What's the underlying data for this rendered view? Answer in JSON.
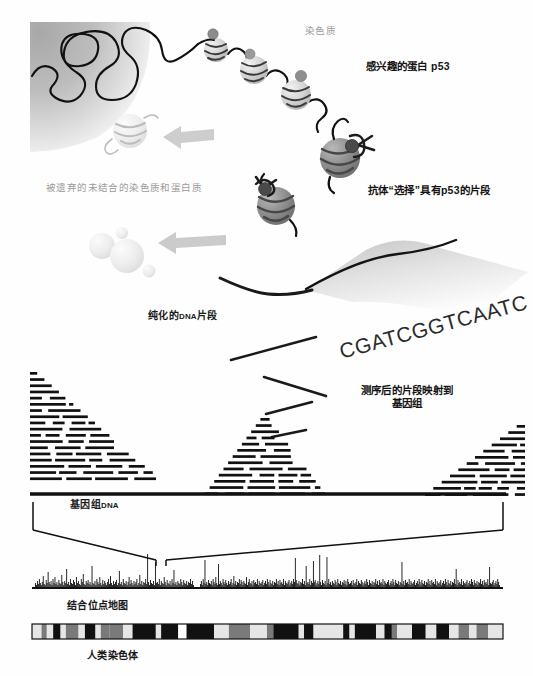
{
  "figure": {
    "title_semantic": "ChIP-seq workflow diagram",
    "background": "#ffffff"
  },
  "labels": {
    "chromatin": "染色质",
    "protein_of_interest": "感兴趣的蛋白 p53",
    "discarded": "被遗弃的未结合的染色质和蛋白质",
    "antibody_selects": "抗体“选择”具有p53的片段",
    "purified_prefix": "纯化的",
    "purified_dna": "DNA",
    "purified_suffix": "片段",
    "mapping_line1": "测序后的片段映射到",
    "mapping_line2": "基因组",
    "genomic_prefix": "基因组",
    "genomic_dna": "DNA",
    "binding_site_map": "结合位点地图",
    "human_chromosome": "人类染色体"
  },
  "sequence": {
    "text": "CGATCGGTCAATC",
    "rotation_deg": -15
  },
  "colors": {
    "ink": "#1a1a1a",
    "gray_label": "#9a9a9a",
    "nucleus_fill_dark": "#9d9d9d",
    "nucleus_fill_light": "#ffffff",
    "nucleosome_light": "#d8d8d8",
    "nucleosome_dark": "#8e8e8e",
    "discard_pale": "#ededed",
    "arrow_gray": "#c9c9c9",
    "peak_black": "#111111",
    "chrom_band_dark": "#111111",
    "chrom_band_mid": "#7a7a7a",
    "chrom_band_light": "#e6e6e6"
  },
  "chart_data": {
    "type": "bar",
    "title": "结合位点地图",
    "xlabel": "",
    "ylabel": "",
    "ylim": [
      0,
      44
    ],
    "grid": false,
    "legend": null,
    "note": "Binding-site peak track: tick heights in px along the genome axis",
    "segments": [
      {
        "name": "left-arm",
        "x_start": 35,
        "x_end": 194,
        "values": [
          5,
          3,
          7,
          4,
          9,
          5,
          3,
          6,
          12,
          4,
          3,
          8,
          5,
          16,
          6,
          4,
          7,
          3,
          9,
          5,
          11,
          4,
          6,
          3,
          8,
          5,
          4,
          13,
          6,
          3,
          7,
          5,
          19,
          4,
          6,
          3,
          9,
          5,
          4,
          8,
          6,
          3,
          11,
          5,
          7,
          4,
          3,
          9,
          6,
          14,
          4,
          3,
          7,
          5,
          8,
          4,
          6,
          3,
          22,
          5,
          4,
          7,
          3,
          9,
          6,
          4,
          11,
          5,
          3,
          8,
          4,
          7,
          5,
          3,
          6,
          9,
          4,
          12,
          5,
          3,
          7,
          4,
          6,
          8,
          3,
          5,
          17,
          4,
          6,
          3,
          9,
          5,
          4,
          7,
          3,
          6,
          11,
          4,
          8,
          5,
          3,
          7,
          4,
          6,
          9,
          3,
          5,
          13,
          4,
          7,
          3,
          6,
          5,
          9,
          4,
          34,
          6,
          3,
          8,
          5,
          4,
          7,
          3,
          26,
          5,
          6,
          4,
          9,
          3,
          7,
          5,
          4,
          11,
          6,
          3,
          8,
          5,
          4,
          7,
          3,
          9,
          5,
          18,
          4,
          6,
          3,
          7,
          5,
          4,
          9,
          6,
          3,
          8,
          5,
          4,
          7,
          3,
          6,
          5,
          9,
          4,
          7,
          3
        ]
      },
      {
        "name": "right-arm",
        "x_start": 200,
        "x_end": 500,
        "values": [
          4,
          7,
          3,
          9,
          5,
          28,
          4,
          6,
          3,
          8,
          5,
          4,
          7,
          3,
          9,
          6,
          4,
          11,
          5,
          3,
          24,
          4,
          7,
          5,
          3,
          9,
          6,
          4,
          8,
          5,
          3,
          7,
          4,
          6,
          9,
          3,
          5,
          12,
          4,
          7,
          3,
          6,
          5,
          9,
          4,
          8,
          6,
          3,
          7,
          5,
          4,
          11,
          3,
          6,
          9,
          5,
          4,
          7,
          3,
          8,
          5,
          6,
          4,
          9,
          3,
          7,
          5,
          4,
          6,
          8,
          3,
          5,
          7,
          4,
          9,
          6,
          3,
          8,
          5,
          4,
          7,
          3,
          6,
          5,
          9,
          4,
          7,
          3,
          8,
          5,
          6,
          4,
          9,
          3,
          7,
          5,
          4,
          6,
          8,
          3,
          5,
          7,
          4,
          9,
          6,
          30,
          8,
          5,
          4,
          7,
          3,
          6,
          5,
          9,
          4,
          7,
          3,
          22,
          5,
          6,
          4,
          9,
          3,
          7,
          5,
          27,
          6,
          8,
          3,
          5,
          7,
          4,
          33,
          6,
          3,
          8,
          5,
          4,
          7,
          3,
          31,
          5,
          9,
          4,
          6,
          3,
          7,
          5,
          4,
          8,
          6,
          3,
          9,
          5,
          4,
          7,
          3,
          6,
          5,
          8,
          4,
          7,
          3,
          9,
          6,
          4,
          5,
          7,
          3,
          8,
          5,
          4,
          6,
          9,
          3,
          7,
          5,
          4,
          8,
          6,
          3,
          5,
          7,
          4,
          9,
          6,
          3,
          8,
          5,
          4,
          7,
          3,
          6,
          5,
          9,
          4,
          7,
          3,
          8,
          5,
          6,
          4,
          9,
          3,
          7,
          5,
          4,
          6,
          8,
          3,
          5,
          7,
          4,
          9,
          6,
          3,
          8,
          5,
          4,
          7,
          3,
          6,
          5,
          26,
          4,
          7,
          3,
          8,
          5,
          6,
          4,
          9,
          3,
          7,
          5,
          4,
          6,
          8,
          3,
          5,
          7,
          4,
          9,
          6,
          3,
          8,
          5,
          4,
          7,
          3,
          6,
          5,
          9,
          4,
          7,
          3,
          8,
          5,
          6,
          4,
          9,
          3,
          7,
          5,
          4,
          6,
          8,
          3,
          5,
          7,
          4,
          9,
          6,
          3,
          8,
          5,
          4,
          7,
          3,
          6,
          5,
          9,
          4,
          19,
          3,
          8,
          5,
          6,
          4,
          9,
          3,
          7,
          5,
          4,
          6,
          8,
          3,
          5,
          7,
          4,
          9,
          6,
          3,
          8,
          5,
          4,
          7,
          3,
          6,
          5,
          9,
          4,
          7,
          3,
          8,
          5,
          6,
          4,
          9,
          3,
          21,
          5,
          4,
          6,
          8,
          3,
          5,
          7,
          4,
          9,
          6,
          3
        ]
      }
    ]
  },
  "chromosome_bands": [
    {
      "w": 9,
      "shade": "light"
    },
    {
      "w": 5,
      "shade": "mid"
    },
    {
      "w": 6,
      "shade": "light"
    },
    {
      "w": 7,
      "shade": "dark"
    },
    {
      "w": 5,
      "shade": "light"
    },
    {
      "w": 12,
      "shade": "mid"
    },
    {
      "w": 6,
      "shade": "light"
    },
    {
      "w": 10,
      "shade": "dark"
    },
    {
      "w": 5,
      "shade": "light"
    },
    {
      "w": 8,
      "shade": "mid"
    },
    {
      "w": 13,
      "shade": "mid"
    },
    {
      "w": 9,
      "shade": "light"
    },
    {
      "w": 22,
      "shade": "dark"
    },
    {
      "w": 5,
      "shade": "light"
    },
    {
      "w": 16,
      "shade": "dark"
    },
    {
      "w": 8,
      "shade": "centromere"
    },
    {
      "w": 26,
      "shade": "dark"
    },
    {
      "w": 14,
      "shade": "light"
    },
    {
      "w": 20,
      "shade": "mid"
    },
    {
      "w": 16,
      "shade": "light"
    },
    {
      "w": 6,
      "shade": "mid"
    },
    {
      "w": 24,
      "shade": "dark"
    },
    {
      "w": 5,
      "shade": "light"
    },
    {
      "w": 9,
      "shade": "dark"
    },
    {
      "w": 28,
      "shade": "light"
    },
    {
      "w": 6,
      "shade": "dark"
    },
    {
      "w": 5,
      "shade": "light"
    },
    {
      "w": 20,
      "shade": "dark"
    },
    {
      "w": 8,
      "shade": "light"
    },
    {
      "w": 7,
      "shade": "dark"
    },
    {
      "w": 5,
      "shade": "mid"
    },
    {
      "w": 14,
      "shade": "light"
    },
    {
      "w": 13,
      "shade": "dark"
    },
    {
      "w": 10,
      "shade": "light"
    },
    {
      "w": 12,
      "shade": "dark"
    },
    {
      "w": 9,
      "shade": "light"
    },
    {
      "w": 10,
      "shade": "mid"
    },
    {
      "w": 7,
      "shade": "light"
    },
    {
      "w": 11,
      "shade": "mid"
    },
    {
      "w": 14,
      "shade": "light"
    }
  ],
  "read_pileups": [
    {
      "name": "pileup-left",
      "x": 30,
      "y": 372,
      "width": 130,
      "rows": 18,
      "peak": "right"
    },
    {
      "name": "pileup-middle",
      "x": 205,
      "y": 418,
      "width": 120,
      "rows": 13,
      "peak": "center"
    },
    {
      "name": "pileup-right",
      "x": 425,
      "y": 425,
      "width": 100,
      "rows": 12,
      "peak": "left"
    }
  ],
  "nucleosomes_chromatin": [
    {
      "cx": 216,
      "cy": 50,
      "r": 12
    },
    {
      "cx": 254,
      "cy": 70,
      "r": 14
    },
    {
      "cx": 296,
      "cy": 95,
      "r": 15
    }
  ],
  "nucleosomes_selected": [
    {
      "cx": 340,
      "cy": 158,
      "r": 20
    },
    {
      "cx": 276,
      "cy": 205,
      "r": 19
    }
  ],
  "free_fragments": [
    {
      "cx": 130,
      "cy": 131,
      "r": 17
    },
    {
      "cx": 102,
      "cy": 246,
      "r": 13
    },
    {
      "cx": 127,
      "cy": 256,
      "r": 16
    },
    {
      "cx": 122,
      "cy": 233,
      "r": 6
    },
    {
      "cx": 148,
      "cy": 270,
      "r": 6
    }
  ],
  "dna_fragments": [
    {
      "name": "fragment-1",
      "x1": 222,
      "y1": 279,
      "x2": 312,
      "y2": 296
    },
    {
      "name": "fragment-2",
      "x1": 231,
      "y1": 360,
      "x2": 315,
      "y2": 338
    },
    {
      "name": "fragment-3",
      "x1": 264,
      "y1": 378,
      "x2": 325,
      "y2": 395
    },
    {
      "name": "fragment-4",
      "x1": 268,
      "y1": 413,
      "x2": 310,
      "y2": 403
    },
    {
      "name": "fragment-5",
      "x1": 274,
      "y1": 436,
      "x2": 305,
      "y2": 431
    }
  ]
}
